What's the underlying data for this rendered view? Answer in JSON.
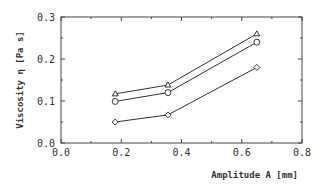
{
  "chart_data": {
    "type": "line",
    "title": "",
    "xlabel": "Amplitude A [mm]",
    "ylabel": "Viscosity η [Pa s]",
    "xlim": [
      0.0,
      0.8
    ],
    "ylim": [
      0.0,
      0.3
    ],
    "xticks": [
      "0.0",
      "0.2",
      "0.4",
      "0.6",
      "0.8"
    ],
    "yticks": [
      "0.0",
      "0.1",
      "0.2",
      "0.3"
    ],
    "grid": false,
    "legend": "none",
    "x": [
      0.18,
      0.355,
      0.65
    ],
    "series": [
      {
        "name": "triangle",
        "marker": "triangle",
        "values": [
          0.117,
          0.138,
          0.26
        ]
      },
      {
        "name": "circle",
        "marker": "circle",
        "values": [
          0.099,
          0.12,
          0.24
        ]
      },
      {
        "name": "diamond",
        "marker": "diamond",
        "values": [
          0.05,
          0.067,
          0.18
        ]
      }
    ]
  },
  "colors": {
    "line": "#333333",
    "frame": "#444444"
  }
}
